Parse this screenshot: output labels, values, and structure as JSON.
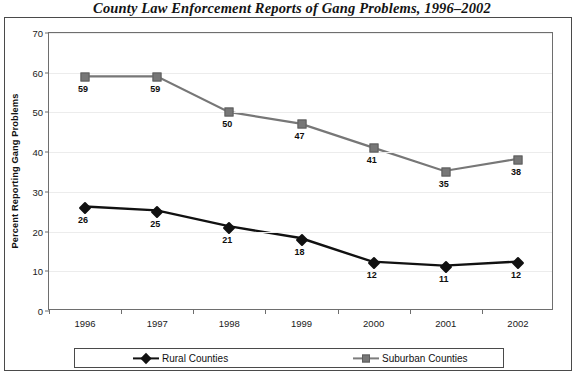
{
  "chart_data": {
    "type": "line",
    "title": "County Law Enforcement Reports of Gang Problems, 1996–2002",
    "xlabel": "",
    "ylabel": "Percent Reporting Gang Problems",
    "categories": [
      "1996",
      "1997",
      "1998",
      "1999",
      "2000",
      "2001",
      "2002"
    ],
    "ylim": [
      0,
      70
    ],
    "ytick_labels": [
      "0",
      "10",
      "20",
      "30",
      "40",
      "50",
      "60",
      "70"
    ],
    "yticks": [
      0,
      10,
      20,
      30,
      40,
      50,
      60,
      70
    ],
    "grid": "horizontal",
    "legend_position": "bottom",
    "series": [
      {
        "name": "Rural Counties",
        "color": "#111111",
        "marker": "diamond",
        "values": [
          26,
          25,
          21,
          18,
          12,
          11,
          12
        ],
        "labels": [
          "26",
          "25",
          "21",
          "18",
          "12",
          "11",
          "12"
        ]
      },
      {
        "name": "Suburban Counties",
        "color": "#777777",
        "marker": "square",
        "values": [
          59,
          59,
          50,
          47,
          41,
          35,
          38
        ],
        "labels": [
          "59",
          "59",
          "50",
          "47",
          "41",
          "35",
          "38"
        ]
      }
    ]
  }
}
